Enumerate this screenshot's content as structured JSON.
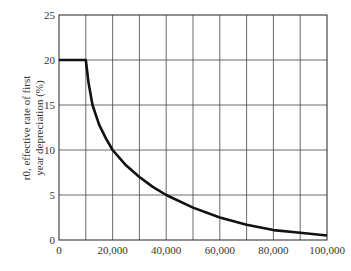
{
  "chart_data": {
    "type": "line",
    "title": "",
    "xlabel": "",
    "ylabel_line1": "r0, effective rate of first",
    "ylabel_line2": "year depreciation (%)",
    "xlim": [
      0,
      100000
    ],
    "ylim": [
      0,
      25
    ],
    "grid": true,
    "x_ticks": [
      "0",
      "20,000",
      "40,000",
      "60,000",
      "80,000",
      "100,000"
    ],
    "y_ticks": [
      "0",
      "5",
      "10",
      "15",
      "20",
      "25"
    ],
    "series": [
      {
        "name": "effective rate of first year depreciation",
        "x": [
          0,
          10000,
          11000,
          12500,
          15000,
          17500,
          20000,
          25000,
          30000,
          35000,
          40000,
          50000,
          60000,
          70000,
          80000,
          90000,
          100000
        ],
        "values": [
          20,
          20,
          17.5,
          15,
          12.8,
          11.3,
          10,
          8.3,
          7,
          5.9,
          5,
          3.6,
          2.5,
          1.7,
          1.1,
          0.8,
          0.5
        ]
      }
    ]
  }
}
